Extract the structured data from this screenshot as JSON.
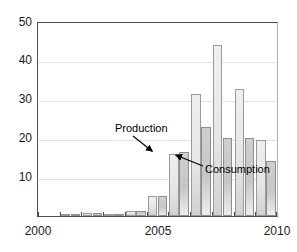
{
  "chart_data": {
    "type": "bar",
    "title": "",
    "subtitle": "",
    "xlabel": "",
    "ylabel": "",
    "categories": [
      "2000",
      "2001",
      "2002",
      "2003",
      "2004",
      "2005",
      "2006",
      "2007",
      "2008",
      "2009",
      "2010"
    ],
    "series": [
      {
        "name": "Production",
        "values": [
          0,
          0.4,
          0.7,
          0.6,
          1.2,
          5.1,
          16.0,
          31.7,
          44.2,
          32.8,
          19.8
        ]
      },
      {
        "name": "Consumption",
        "values": [
          0,
          0.4,
          0.8,
          0.6,
          1.2,
          5.2,
          16.5,
          23.0,
          20.2,
          20.3,
          14.3
        ]
      }
    ],
    "ylim": [
      0,
      50
    ],
    "xlim": [
      2000,
      2010
    ],
    "yticks": [
      10,
      20,
      30,
      40,
      50
    ],
    "ytick_labels": [
      "10",
      "20",
      "30",
      "40",
      "50"
    ],
    "xticks": [
      2000,
      2005,
      2010
    ],
    "xtick_labels": [
      "2000",
      "2005",
      "2010"
    ],
    "grid": true,
    "legend_position": "none",
    "annotations": [
      {
        "label": "Production",
        "points_to_series": "Production",
        "points_to_category": "2005"
      },
      {
        "label": "Consumption",
        "points_to_series": "Consumption",
        "points_to_category": "2006"
      }
    ],
    "colors": {
      "production": "#e6e6e6",
      "consumption": "#c6c6c6",
      "axis": "#4d4d4d",
      "grid": "#e3e3e3",
      "text": "#1a1a1a",
      "background": "#ffffff"
    }
  }
}
